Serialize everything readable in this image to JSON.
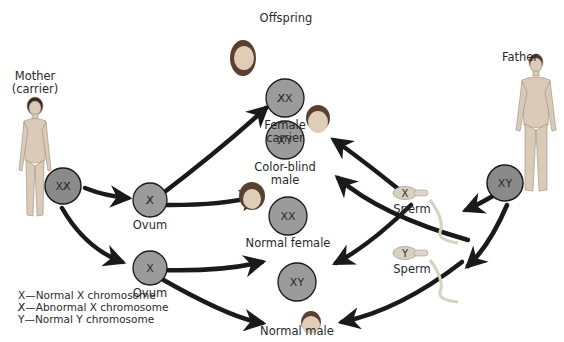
{
  "title": "Offspring",
  "parents": {
    "mother": {
      "label_line1": "Mother",
      "label_line2": "(carrier)",
      "genotype": "XX̸"
    },
    "father": {
      "label": "Father",
      "genotype": "XY"
    }
  },
  "gametes": {
    "ovum_abnormal": {
      "label": "Ovum",
      "genotype": "X̸"
    },
    "ovum_normal": {
      "label": "Ovum",
      "genotype": "X"
    },
    "sperm_x": {
      "label": "Sperm",
      "genotype": "X"
    },
    "sperm_y": {
      "label": "Sperm",
      "genotype": "Y"
    }
  },
  "offspring": [
    {
      "genotype": "X̸X",
      "label_line1": "Female",
      "label_line2": "carrier"
    },
    {
      "genotype": "X̸Y",
      "label_line1": "Color-blind",
      "label_line2": "male"
    },
    {
      "genotype": "XX",
      "label_line1": "Normal female",
      "label_line2": ""
    },
    {
      "genotype": "XY",
      "label_line1": "Normal male",
      "label_line2": ""
    }
  ],
  "legend": [
    {
      "symbol": "X",
      "text": "—Normal X chromosome"
    },
    {
      "symbol": "X̸",
      "text": "—Abnormal X chromosome"
    },
    {
      "symbol": "Y",
      "text": "—Normal Y chromosome"
    }
  ],
  "colors": {
    "cell_fill": "#9b9b9b",
    "parent_cell_fill": "#8a8a8a",
    "arrow": "#1a1a1a",
    "skin": "#d9cbb8"
  }
}
